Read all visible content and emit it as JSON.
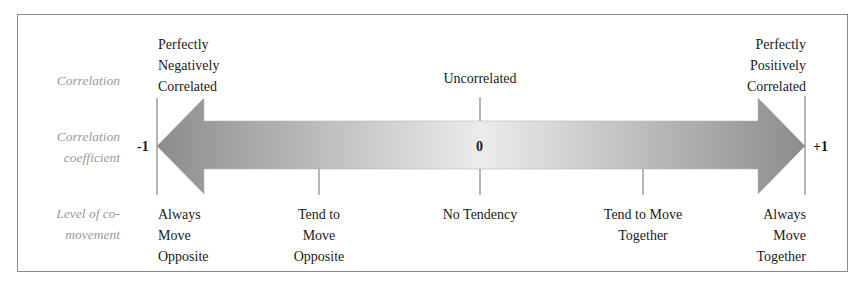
{
  "diagram": {
    "row_labels": {
      "correlation": "Correlation",
      "coefficient_line1": "Correlation",
      "coefficient_line2": "coefficient",
      "comovement_line1": "Level of co-",
      "comovement_line2": "movement"
    },
    "correlation_labels": {
      "negative": [
        "Perfectly",
        "Negatively",
        "Correlated"
      ],
      "uncorrelated": "Uncorrelated",
      "positive": [
        "Perfectly",
        "Positively",
        "Correlated"
      ]
    },
    "coefficients": {
      "min": "-1",
      "mid": "0",
      "max": "+1"
    },
    "comovement_labels": {
      "always_opposite": [
        "Always",
        "Move",
        "Opposite"
      ],
      "tend_opposite": [
        "Tend to",
        "Move",
        "Opposite"
      ],
      "no_tendency": "No Tendency",
      "tend_together": [
        "Tend to Move",
        "Together"
      ],
      "always_together": [
        "Always",
        "Move",
        "Together"
      ]
    },
    "scale": {
      "range": [
        -1,
        1
      ],
      "ticks": [
        -1,
        -0.5,
        0,
        0.5,
        1
      ]
    },
    "colors": {
      "arrow_edge": "#8c8c8c",
      "arrow_center": "#ececec",
      "line": "#6e6e6e",
      "row_label": "#9a9a9a"
    }
  }
}
